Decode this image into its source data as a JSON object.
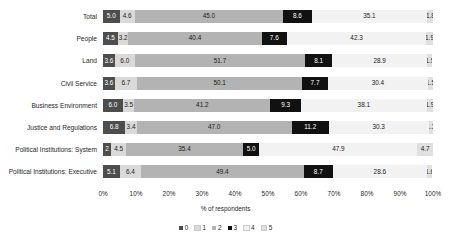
{
  "chart_data": {
    "type": "bar",
    "orientation": "horizontal",
    "stacked": true,
    "normalized": true,
    "title": "",
    "xlabel": "% of respondents",
    "ylabel": "",
    "xlim": [
      0,
      100
    ],
    "xticks": [
      "0%",
      "10%",
      "20%",
      "30%",
      "40%",
      "50%",
      "60%",
      "70%",
      "80%",
      "90%",
      "100%"
    ],
    "xtick_values": [
      0,
      10,
      20,
      30,
      40,
      50,
      60,
      70,
      80,
      90,
      100
    ],
    "grid": false,
    "legend_position": "bottom",
    "categories": [
      "Total",
      "People",
      "Land",
      "Civil Service",
      "Business Environment",
      "Justice and Regulations",
      "Political Institutions: System",
      "Political Institutions: Executive"
    ],
    "series": [
      {
        "name": "0",
        "color": "#4d4d4d",
        "text_color": "#ffffff",
        "values": [
          5.0,
          4.5,
          3.6,
          3.6,
          6.0,
          6.8,
          2.5,
          5.1
        ]
      },
      {
        "name": "1",
        "color": "#d9d9d9",
        "text_color": "#1a1a1a",
        "values": [
          4.6,
          3.2,
          6.0,
          6.7,
          3.5,
          3.4,
          4.5,
          6.4
        ]
      },
      {
        "name": "2",
        "color": "#b3b3b3",
        "text_color": "#1a1a1a",
        "values": [
          45.0,
          40.4,
          51.7,
          50.1,
          41.2,
          47.0,
          35.4,
          49.4
        ]
      },
      {
        "name": "3",
        "color": "#111111",
        "text_color": "#ffffff",
        "values": [
          8.6,
          7.6,
          8.1,
          7.7,
          9.3,
          11.2,
          5.0,
          8.7
        ]
      },
      {
        "name": "4",
        "color": "#f2f2f2",
        "text_color": "#1a1a1a",
        "values": [
          35.1,
          42.3,
          28.9,
          30.4,
          38.1,
          30.3,
          47.9,
          28.6
        ]
      },
      {
        "name": "5",
        "color": "#e0e0e0",
        "text_color": "#1a1a1a",
        "values": [
          1.8,
          1.9,
          1.5,
          1.5,
          1.9,
          1.3,
          4.7,
          1.6
        ]
      }
    ],
    "value_labels": {
      "Total": [
        "5.0",
        "4.6",
        "45.0",
        "8.6",
        "35.1",
        "1.8"
      ],
      "People": [
        "4.5",
        "3.2",
        "40.4",
        "7.6",
        "42.3",
        "1.9"
      ],
      "Land": [
        "3.6",
        "6.0",
        "51.7",
        "8.1",
        "28.9",
        "1.5"
      ],
      "Civil Service": [
        "3.6",
        "6.7",
        "50.1",
        "7.7",
        "30.4",
        "1.5"
      ],
      "Business Environment": [
        "6.0",
        "3.5",
        "41.2",
        "9.3",
        "38.1",
        "1.9"
      ],
      "Justice and Regulations": [
        "6.8",
        "3.4",
        "47.0",
        "11.2",
        "30.3",
        "1.3"
      ],
      "Political Institutions: System": [
        "2",
        "4.5",
        "35.4",
        "5.0",
        "47.9",
        "4.7"
      ],
      "Political Institutions: Executive": [
        "5.1",
        "6.4",
        "49.4",
        "8.7",
        "28.6",
        "1.6"
      ]
    },
    "legend_entries": [
      "0",
      "1",
      "2",
      "3",
      "4",
      "5"
    ]
  }
}
